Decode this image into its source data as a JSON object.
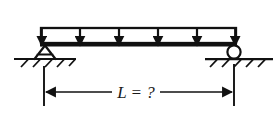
{
  "figure": {
    "background_color": "#ffffff",
    "ink_color": "#111111"
  },
  "beam": {
    "name": "beam-member",
    "x_start": 41,
    "x_end": 236,
    "y": 45,
    "thickness": 2.6
  },
  "load": {
    "name": "uniformly-distributed-load",
    "type": "uniform",
    "box_top_y": 28,
    "box_bottom_y": 43,
    "x_start": 41,
    "x_end": 236,
    "arrow_count": 6,
    "arrow_x_positions": [
      41,
      80,
      119,
      158,
      197,
      236
    ],
    "direction": "down"
  },
  "supports": {
    "left": {
      "name": "pin-support",
      "type": "pinned",
      "x": 45,
      "apex_y": 45,
      "base_y": 58,
      "half_width": 11,
      "ground_x_start": 14,
      "ground_x_end": 76,
      "hatch_count": 5
    },
    "right": {
      "name": "roller-support",
      "type": "roller",
      "x": 234,
      "center_y": 52,
      "radius": 7,
      "ground_y": 59,
      "ground_x_start": 205,
      "ground_x_end": 273,
      "hatch_count": 5
    }
  },
  "dimension": {
    "name": "span-dimension",
    "label": "L = ?",
    "symbol": "L",
    "equals": "=",
    "value": "?",
    "line_y": 92,
    "x_start": 44,
    "x_end": 234,
    "extension_top_y": 66,
    "extension_bottom_y": 106,
    "arrow_direction": "both-outward"
  },
  "labels": {
    "span_label": "L = ?"
  }
}
